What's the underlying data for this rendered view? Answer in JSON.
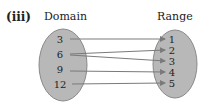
{
  "part_label": "(iii)",
  "domain": {
    "title": "Domain",
    "values": [
      "3",
      "6",
      "9",
      "12"
    ]
  },
  "range": {
    "title": "Range",
    "values": [
      "1",
      "2",
      "3",
      "4",
      "5"
    ]
  },
  "mappings": [
    {
      "from": "3",
      "to": "1"
    },
    {
      "from": "6",
      "to": "2"
    },
    {
      "from": "6",
      "to": "3"
    },
    {
      "from": "9",
      "to": "4"
    },
    {
      "from": "12",
      "to": "5"
    }
  ],
  "colors": {
    "oval_fill": "#b8b8b8",
    "oval_stroke": "#8a8a8a",
    "arrow": "#7a7a7a"
  }
}
